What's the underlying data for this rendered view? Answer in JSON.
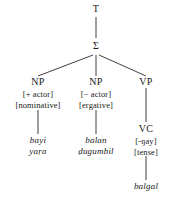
{
  "diagram": {
    "background": "#ffffff",
    "line_color": "#2b2b2b",
    "nodes": {
      "t": {
        "label": "T"
      },
      "sigma": {
        "label": "Σ"
      },
      "np1": {
        "label": "NP",
        "features": [
          "[+ actor]",
          "[nominative]"
        ],
        "leaf": [
          "bayi",
          "yaṛa"
        ]
      },
      "np2": {
        "label": "NP",
        "features": [
          "[− actor]",
          "[ergative]"
        ],
        "leaf": [
          "balan",
          "ḍugumbil"
        ]
      },
      "vp": {
        "label": "VP"
      },
      "vc": {
        "label": "VC",
        "features": [
          "[-ŋay]",
          "[tense]"
        ],
        "leaf": [
          "balgal"
        ]
      }
    }
  }
}
